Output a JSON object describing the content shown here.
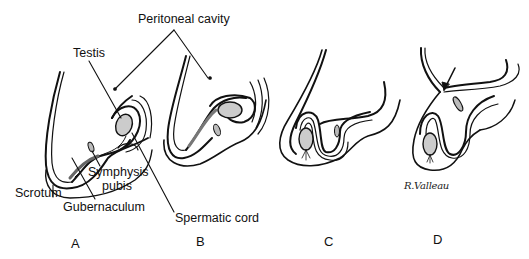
{
  "figure": {
    "labels": {
      "peritoneal_cavity": "Peritoneal cavity",
      "testis": "Testis",
      "symphysis_pubis_line1": "Symphysis",
      "symphysis_pubis_line2": "pubis",
      "scrotum": "Scrotum",
      "gubernaculum": "Gubernaculum",
      "spermatic_cord": "Spermatic cord"
    },
    "panels": [
      {
        "id": "A",
        "label": "A"
      },
      {
        "id": "B",
        "label": "B"
      },
      {
        "id": "C",
        "label": "C"
      },
      {
        "id": "D",
        "label": "D"
      }
    ],
    "signature": "R.Valleau",
    "colors": {
      "ink": "#111111",
      "background": "#ffffff"
    }
  }
}
